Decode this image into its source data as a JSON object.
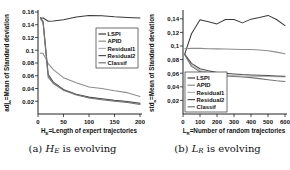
{
  "figure": {
    "panels": [
      {
        "id": "panel-a",
        "caption_prefix": "(a) ",
        "caption_var": "H",
        "caption_sub": "E",
        "caption_suffix": " is evolving"
      },
      {
        "id": "panel-b",
        "caption_prefix": "(b) ",
        "caption_var": "L",
        "caption_sub": "R",
        "caption_suffix": " is evolving"
      }
    ]
  },
  "chart_data": [
    {
      "type": "line",
      "title": "",
      "xlabel": "H_E=Length of expert trajectories",
      "xlabel_var": "H",
      "xlabel_sub": "E",
      "xlabel_rest": "=Length of expert trajectories",
      "ylabel": "adj_a =Mean of Standard deviation",
      "ylabel_var": "adj",
      "ylabel_sub": "a",
      "ylabel_rest": "=Mean of Standard deviation",
      "xlim": [
        0,
        200
      ],
      "ylim": [
        0,
        0.16
      ],
      "xticks": [
        0,
        50,
        100,
        150,
        200
      ],
      "xticklabels": [
        "0",
        "50",
        "100",
        "150",
        "200"
      ],
      "yticks": [
        0.02,
        0.04,
        0.06,
        0.08,
        0.1,
        0.12,
        0.14,
        0.16
      ],
      "yticklabels": [
        "0.02",
        "0.04",
        "0.06",
        "0.08",
        "0.1",
        "0.12",
        "0.14",
        "0.16"
      ],
      "grid": false,
      "legend_position": "center-right",
      "x": [
        5,
        10,
        20,
        30,
        50,
        75,
        100,
        125,
        150,
        175,
        200
      ],
      "series": [
        {
          "name": "LSPI",
          "color": "#3a3a3a",
          "values": [
            0.1505,
            0.1505,
            0.1455,
            0.146,
            0.148,
            0.152,
            0.1545,
            0.154,
            0.1525,
            0.1515,
            0.1505
          ]
        },
        {
          "name": "APID",
          "color": "#8c8c8c",
          "values": [
            0.0955,
            0.095,
            0.079,
            0.0695,
            0.057,
            0.049,
            0.0425,
            0.04,
            0.0365,
            0.0335,
            0.0275
          ]
        },
        {
          "name": "Residual1",
          "color": "#b0b0b0",
          "values": [
            0.149,
            0.142,
            0.057,
            0.0475,
            0.037,
            0.03,
            0.026,
            0.0235,
            0.021,
            0.019,
            0.0165
          ]
        },
        {
          "name": "Residual2",
          "color": "#4f4f4f",
          "values": [
            0.151,
            0.145,
            0.0625,
            0.05,
            0.0385,
            0.031,
            0.0265,
            0.024,
            0.0215,
            0.0195,
            0.017
          ]
        },
        {
          "name": "Classif",
          "color": "#747474",
          "values": [
            0.15,
            0.1435,
            0.059,
            0.0485,
            0.0375,
            0.0303,
            0.025,
            0.0225,
            0.02,
            0.018,
            0.015
          ]
        }
      ]
    },
    {
      "type": "line",
      "title": "",
      "xlabel": "L_R=Number of random trajectories",
      "xlabel_var": "L",
      "xlabel_sub": "R",
      "xlabel_rest": "=Number of random trajectories",
      "ylabel": "std_a =Mean of Standard deviation",
      "ylabel_var": "std",
      "ylabel_sub": "a",
      "ylabel_rest": "=Mean of Standard deviation",
      "xlim": [
        0,
        600
      ],
      "ylim": [
        0,
        0.15
      ],
      "xticks": [
        0,
        100,
        200,
        300,
        400,
        500,
        600
      ],
      "xticklabels": [
        "0",
        "100",
        "200",
        "300",
        "400",
        "500",
        "600"
      ],
      "yticks": [
        0.02,
        0.04,
        0.06,
        0.08,
        0.1,
        0.12,
        0.14
      ],
      "yticklabels": [
        "0,02",
        "0,04",
        "0,06",
        "0,08",
        "0,1",
        "0,12",
        "0,14"
      ],
      "grid": false,
      "legend_position": "lower-left",
      "x": [
        10,
        50,
        100,
        150,
        200,
        250,
        300,
        350,
        400,
        450,
        500,
        550,
        600
      ],
      "series": [
        {
          "name": "LSPI",
          "color": "#3a3a3a",
          "values": [
            0.088,
            0.118,
            0.1385,
            0.1355,
            0.1325,
            0.139,
            0.139,
            0.134,
            0.1395,
            0.142,
            0.145,
            0.139,
            0.13
          ]
        },
        {
          "name": "APID",
          "color": "#8c8c8c",
          "values": [
            0.096,
            0.0965,
            0.0965,
            0.096,
            0.0958,
            0.0955,
            0.0952,
            0.095,
            0.0948,
            0.094,
            0.093,
            0.091,
            0.0885
          ]
        },
        {
          "name": "Residual1",
          "color": "#b0b0b0",
          "values": [
            0.0875,
            0.072,
            0.064,
            0.061,
            0.0585,
            0.0575,
            0.0565,
            0.056,
            0.0555,
            0.0552,
            0.055,
            0.0548,
            0.0545
          ]
        },
        {
          "name": "Residual2",
          "color": "#4f4f4f",
          "values": [
            0.088,
            0.0745,
            0.0665,
            0.0635,
            0.061,
            0.0598,
            0.0588,
            0.058,
            0.0575,
            0.057,
            0.0565,
            0.056,
            0.0555
          ]
        },
        {
          "name": "Classif",
          "color": "#747474",
          "values": [
            0.087,
            0.07,
            0.062,
            0.059,
            0.057,
            0.056,
            0.0552,
            0.0545,
            0.0535,
            0.052,
            0.0505,
            0.049,
            0.0478
          ]
        }
      ]
    }
  ]
}
